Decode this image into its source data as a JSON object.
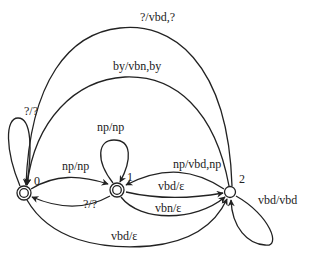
{
  "diagram": {
    "type": "finite-state transducer",
    "nodes": [
      {
        "id": "0",
        "label": "0",
        "accepting": true
      },
      {
        "id": "1",
        "label": "1",
        "accepting": true
      },
      {
        "id": "2",
        "label": "2",
        "accepting": false
      }
    ],
    "edges": [
      {
        "from": "0",
        "to": "0",
        "label": "?/?"
      },
      {
        "from": "0",
        "to": "1",
        "label": "np/np"
      },
      {
        "from": "1",
        "to": "0",
        "label": "?/?"
      },
      {
        "from": "1",
        "to": "1",
        "label": "np/np"
      },
      {
        "from": "1",
        "to": "2",
        "label": "vbd/ε"
      },
      {
        "from": "1",
        "to": "2",
        "label": "vbn/ε"
      },
      {
        "from": "2",
        "to": "1",
        "label": "np/vbd,np"
      },
      {
        "from": "2",
        "to": "2",
        "label": "vbd/vbd"
      },
      {
        "from": "2",
        "to": "0",
        "label": "?/vbd,?"
      },
      {
        "from": "2",
        "to": "0",
        "label": "by/vbn,by"
      },
      {
        "from": "0",
        "to": "2",
        "label": "vbd/ε"
      }
    ]
  }
}
